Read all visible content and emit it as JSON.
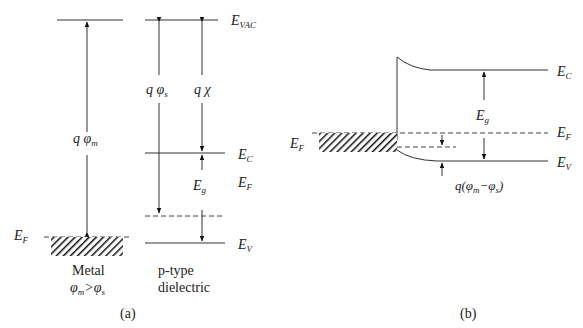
{
  "panel_a": {
    "caption": "(a)",
    "levels": {
      "vac": {
        "main": "E",
        "sub": "VAC"
      },
      "ec": {
        "main": "E",
        "sub": "C"
      },
      "ef_right": {
        "main": "E",
        "sub": "F"
      },
      "ev": {
        "main": "E",
        "sub": "V"
      },
      "ef_metal": {
        "main": "E",
        "sub": "F"
      }
    },
    "arrows": {
      "metal_workfunction": {
        "main": "q φ",
        "sub": "m"
      },
      "semi_workfunction": {
        "main": "q φ",
        "sub": "s"
      },
      "electron_affinity": {
        "main": "q χ"
      },
      "gap": {
        "main": "E",
        "sub": "g"
      }
    },
    "metal_label": "Metal",
    "metal_condition": {
      "a": "φ",
      "a_sub": "m",
      "op": ">",
      "b": "φ",
      "b_sub": "s"
    },
    "dielectric_label_1": "p-type",
    "dielectric_label_2": "dielectric"
  },
  "panel_b": {
    "caption": "(b)",
    "levels": {
      "ec": {
        "main": "E",
        "sub": "C"
      },
      "ef_right": {
        "main": "E",
        "sub": "F"
      },
      "ev": {
        "main": "E",
        "sub": "V"
      },
      "ef_metal": {
        "main": "E",
        "sub": "F"
      }
    },
    "gap": {
      "main": "E",
      "sub": "g"
    },
    "band_bending": {
      "prefix": "q(",
      "a": "φ",
      "a_sub": "m",
      "op": "−",
      "b": "φ",
      "b_sub": "s",
      "suffix": ")"
    }
  }
}
